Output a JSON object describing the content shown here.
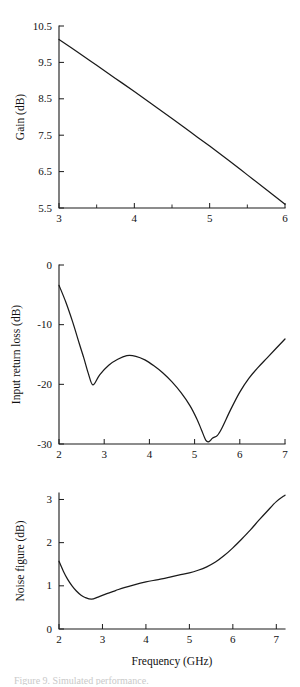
{
  "figure": {
    "name": "lna-performance-figure",
    "partial_caption": "Figure 9.  Simulated performance."
  },
  "chart_data": [
    {
      "id": "gain",
      "type": "line",
      "title": "",
      "xlabel": "",
      "ylabel": "Gain (dB)",
      "xlim": [
        3,
        6
      ],
      "ylim": [
        5.5,
        10.5
      ],
      "xticks": [
        3,
        4,
        5,
        6
      ],
      "xticklabels": [
        "3",
        "4",
        "5",
        "6"
      ],
      "xticks_minor": [
        3.5,
        4.5,
        5.5
      ],
      "yticks": [
        5.5,
        6.5,
        7.5,
        8.5,
        9.5,
        10.5
      ],
      "yticklabels": [
        "5.5",
        "6.5",
        "7.5",
        "8.5",
        "9.5",
        "10.5"
      ],
      "grid": false,
      "legend": "none",
      "series": [
        {
          "name": "Gain",
          "x": [
            3.0,
            3.25,
            3.5,
            3.75,
            4.0,
            4.25,
            4.5,
            4.75,
            5.0,
            5.25,
            5.5,
            5.75,
            6.0
          ],
          "y": [
            10.13,
            9.78,
            9.42,
            9.06,
            8.7,
            8.33,
            7.96,
            7.58,
            7.2,
            6.81,
            6.41,
            6.01,
            5.6
          ]
        }
      ]
    },
    {
      "id": "input-return-loss",
      "type": "line",
      "title": "",
      "xlabel": "",
      "ylabel": "Input return loss (dB)",
      "xlim": [
        2,
        7
      ],
      "ylim": [
        -30,
        0
      ],
      "xticks": [
        2,
        3,
        4,
        5,
        6,
        7
      ],
      "xticklabels": [
        "2",
        "3",
        "4",
        "5",
        "6",
        "7"
      ],
      "xticks_minor": [],
      "yticks": [
        -30,
        -20,
        -10,
        0
      ],
      "yticklabels": [
        "-30",
        "-20",
        "-10",
        "0"
      ],
      "grid": false,
      "legend": "none",
      "series": [
        {
          "name": "Input return loss",
          "x": [
            2.0,
            2.15,
            2.3,
            2.45,
            2.55,
            2.65,
            2.75,
            2.9,
            3.1,
            3.3,
            3.5,
            3.7,
            3.9,
            4.1,
            4.3,
            4.5,
            4.7,
            4.9,
            5.05,
            5.15,
            5.25,
            5.32,
            5.4,
            5.5,
            5.6,
            5.8,
            6.0,
            6.2,
            6.4,
            6.6,
            6.8,
            7.0
          ],
          "y": [
            -3.4,
            -6.2,
            -9.5,
            -13.2,
            -15.6,
            -18.2,
            -20.1,
            -18.4,
            -16.8,
            -15.8,
            -15.2,
            -15.3,
            -15.9,
            -16.9,
            -18.1,
            -19.6,
            -21.4,
            -23.6,
            -25.8,
            -27.6,
            -29.4,
            -29.6,
            -29.0,
            -28.6,
            -27.4,
            -24.2,
            -21.3,
            -19.0,
            -17.2,
            -15.6,
            -14.0,
            -12.4
          ]
        }
      ]
    },
    {
      "id": "noise-figure",
      "type": "line",
      "title": "",
      "xlabel": "Frequency (GHz)",
      "ylabel": "Noise figure (dB)",
      "xlim": [
        2,
        7.2
      ],
      "ylim": [
        0,
        3.15
      ],
      "xticks": [
        2,
        3,
        4,
        5,
        6,
        7
      ],
      "xticklabels": [
        "2",
        "3",
        "4",
        "5",
        "6",
        "7"
      ],
      "xticks_minor": [],
      "yticks": [
        0,
        1,
        2,
        3
      ],
      "yticklabels": [
        "0",
        "1",
        "2",
        "3"
      ],
      "grid": false,
      "legend": "none",
      "series": [
        {
          "name": "Noise figure",
          "x": [
            2.0,
            2.1,
            2.2,
            2.3,
            2.4,
            2.5,
            2.6,
            2.75,
            2.9,
            3.1,
            3.3,
            3.5,
            3.75,
            4.0,
            4.25,
            4.5,
            4.75,
            5.0,
            5.2,
            5.4,
            5.6,
            5.8,
            6.0,
            6.2,
            6.4,
            6.6,
            6.8,
            7.0,
            7.2
          ],
          "y": [
            1.57,
            1.34,
            1.15,
            1.0,
            0.88,
            0.79,
            0.73,
            0.69,
            0.74,
            0.82,
            0.89,
            0.96,
            1.03,
            1.09,
            1.14,
            1.19,
            1.25,
            1.3,
            1.36,
            1.44,
            1.55,
            1.7,
            1.88,
            2.08,
            2.29,
            2.52,
            2.74,
            2.95,
            3.1
          ]
        }
      ]
    }
  ]
}
